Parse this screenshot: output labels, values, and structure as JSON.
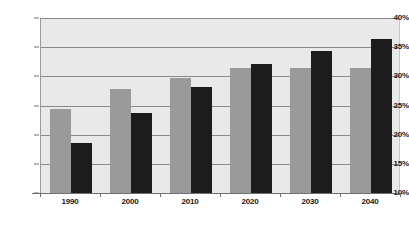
{
  "chart_data": {
    "type": "bar",
    "title": "",
    "subtitle": "",
    "xlabel": "",
    "ylabel": "",
    "categories": [
      "1990",
      "2000",
      "2010",
      "2020",
      "2030",
      "2040"
    ],
    "series": [
      {
        "name": "series-gray",
        "color": "#9a9a9a",
        "values": [
          24.4,
          27.9,
          29.8,
          31.4,
          31.4,
          31.4
        ]
      },
      {
        "name": "series-dark",
        "color": "#1c1c1c",
        "values": [
          18.5,
          23.7,
          28.2,
          32.1,
          34.4,
          36.4
        ]
      }
    ],
    "ylim": [
      10,
      40
    ],
    "ytick_values": [
      10,
      15,
      20,
      25,
      30,
      35,
      40
    ],
    "ytick_labels": [
      "10%",
      "15%",
      "20%",
      "25%",
      "30%",
      "35%",
      "40%"
    ],
    "grid": true,
    "legend": "none",
    "plot_background": "#e9e9e9",
    "gridline_color": "#8a8a8a",
    "axis_color": "#6f6f6f"
  }
}
